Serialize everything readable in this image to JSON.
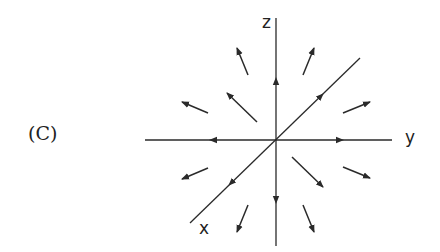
{
  "figure": {
    "panel_label": "(C)",
    "axes": {
      "z": "z",
      "y": "y",
      "x": "x"
    },
    "colors": {
      "ink": "#2a2a2a",
      "background": "#ffffff"
    }
  }
}
